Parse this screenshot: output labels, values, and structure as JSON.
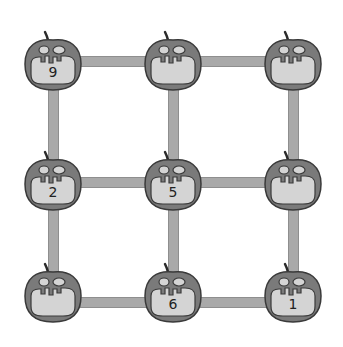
{
  "diagram": {
    "colors": {
      "pumpkin": "#7a7a7a",
      "mouth": "#d4d4d4",
      "connector": "#a9a9a9",
      "outline": "#3a3a3a"
    },
    "nodes": [
      {
        "id": "r1c1",
        "label": "9"
      },
      {
        "id": "r1c2",
        "label": ""
      },
      {
        "id": "r1c3",
        "label": ""
      },
      {
        "id": "r2c1",
        "label": "2"
      },
      {
        "id": "r2c2",
        "label": "5"
      },
      {
        "id": "r2c3",
        "label": ""
      },
      {
        "id": "r3c1",
        "label": ""
      },
      {
        "id": "r3c2",
        "label": "6"
      },
      {
        "id": "r3c3",
        "label": "1"
      }
    ]
  }
}
